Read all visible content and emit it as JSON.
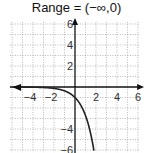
{
  "title": "Range = (−∞,0)",
  "chart_data": {
    "type": "line",
    "title": "Range = (−∞,0)",
    "function": "y = -e^x",
    "xlabel": "",
    "ylabel": "",
    "xlim": [
      -6,
      6
    ],
    "ylim": [
      -6,
      6
    ],
    "grid": true,
    "x_ticks": [
      -4,
      -2,
      2,
      4,
      6
    ],
    "y_ticks": [
      6,
      4,
      2,
      -4,
      -6
    ],
    "series": [
      {
        "name": "y = -e^x",
        "x": [
          -6,
          -5,
          -4,
          -3,
          -2,
          -1,
          -0.5,
          0,
          0.5,
          1,
          1.5,
          1.79
        ],
        "y": [
          -0.002,
          -0.007,
          -0.018,
          -0.05,
          -0.135,
          -0.368,
          -0.607,
          -1,
          -1.649,
          -2.718,
          -4.482,
          -6
        ]
      }
    ],
    "annotations": [
      "left arrow on curve indicating asymptote y=0 as x→−∞"
    ]
  },
  "axes": {
    "x_labels": [
      "−4",
      "−2",
      "2",
      "4",
      "6"
    ],
    "y_labels": [
      "6",
      "4",
      "2",
      "−4",
      "−6"
    ]
  }
}
